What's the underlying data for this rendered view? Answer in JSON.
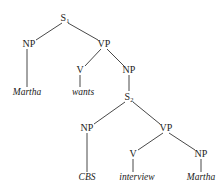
{
  "diagram": {
    "type": "syntax-tree",
    "nodes": [
      {
        "id": "S1",
        "label": "S",
        "subscript": "1",
        "x": 65,
        "y": 18
      },
      {
        "id": "NP1",
        "label": "NP",
        "x": 29,
        "y": 44
      },
      {
        "id": "VP1",
        "label": "VP",
        "x": 104,
        "y": 44
      },
      {
        "id": "Martha1",
        "label": "Martha",
        "leaf": true,
        "x": 27,
        "y": 93
      },
      {
        "id": "V1",
        "label": "V",
        "x": 80,
        "y": 70
      },
      {
        "id": "NP2",
        "label": "NP",
        "x": 129,
        "y": 70
      },
      {
        "id": "wants",
        "label": "wants",
        "leaf": true,
        "x": 86,
        "y": 93
      },
      {
        "id": "S2",
        "label": "S",
        "subscript": "2",
        "x": 129,
        "y": 97
      },
      {
        "id": "NP3",
        "label": "NP",
        "x": 87,
        "y": 128
      },
      {
        "id": "VP2",
        "label": "VP",
        "x": 166,
        "y": 128
      },
      {
        "id": "CBS",
        "label": "CBS",
        "leaf": true,
        "x": 87,
        "y": 178
      },
      {
        "id": "V2",
        "label": "V",
        "x": 133,
        "y": 154
      },
      {
        "id": "NP4",
        "label": "NP",
        "x": 201,
        "y": 154
      },
      {
        "id": "interview",
        "label": "interview",
        "leaf": true,
        "x": 135,
        "y": 178
      },
      {
        "id": "Martha2",
        "label": "Martha",
        "leaf": true,
        "x": 201,
        "y": 178
      }
    ],
    "edges": [
      [
        "S1",
        "NP1"
      ],
      [
        "S1",
        "VP1"
      ],
      [
        "NP1",
        "Martha1"
      ],
      [
        "VP1",
        "V1"
      ],
      [
        "VP1",
        "NP2"
      ],
      [
        "V1",
        "wants"
      ],
      [
        "NP2",
        "S2"
      ],
      [
        "S2",
        "NP3"
      ],
      [
        "S2",
        "VP2"
      ],
      [
        "NP3",
        "CBS"
      ],
      [
        "VP2",
        "V2"
      ],
      [
        "VP2",
        "NP4"
      ],
      [
        "V2",
        "interview"
      ],
      [
        "NP4",
        "Martha2"
      ]
    ]
  }
}
